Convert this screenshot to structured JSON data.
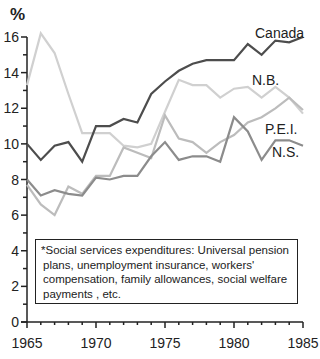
{
  "chart_data": {
    "type": "line",
    "title": "",
    "xlabel": "",
    "ylabel": "%",
    "xlim": [
      1965,
      1985
    ],
    "ylim": [
      0,
      16
    ],
    "x_ticks": [
      1965,
      1970,
      1975,
      1980,
      1985
    ],
    "y_ticks": [
      0,
      2,
      4,
      6,
      8,
      10,
      12,
      14,
      16
    ],
    "grid": false,
    "legend": "inline labels at line ends",
    "x": [
      1965,
      1966,
      1967,
      1968,
      1969,
      1970,
      1971,
      1972,
      1973,
      1974,
      1975,
      1976,
      1977,
      1978,
      1979,
      1980,
      1981,
      1982,
      1983,
      1984,
      1985
    ],
    "series": [
      {
        "name": "Canada",
        "color": "#4d4d4d",
        "values": [
          10.0,
          9.1,
          9.9,
          10.1,
          9.0,
          11.0,
          11.0,
          11.4,
          11.2,
          12.8,
          13.5,
          14.1,
          14.5,
          14.7,
          14.7,
          14.7,
          15.6,
          15.0,
          15.8,
          15.7,
          16.0
        ]
      },
      {
        "name": "N.B.",
        "color": "#d0d0d0",
        "values": [
          13.3,
          16.2,
          15.1,
          12.8,
          10.6,
          10.6,
          10.6,
          9.9,
          9.8,
          10.0,
          11.8,
          13.6,
          13.3,
          13.3,
          12.6,
          13.1,
          13.2,
          12.6,
          13.2,
          12.6,
          11.7
        ]
      },
      {
        "name": "P.E.I.",
        "color": "#bcbcbc",
        "values": [
          7.7,
          6.6,
          6.0,
          7.6,
          7.2,
          8.2,
          8.2,
          9.8,
          9.5,
          9.2,
          11.6,
          10.3,
          10.1,
          9.5,
          10.1,
          10.5,
          11.2,
          11.5,
          12.0,
          12.6,
          11.9
        ]
      },
      {
        "name": "N.S.",
        "color": "#8c8c8c",
        "values": [
          8.0,
          7.1,
          7.4,
          7.2,
          7.1,
          8.1,
          8.0,
          8.2,
          8.2,
          9.3,
          10.1,
          9.1,
          9.3,
          9.3,
          9.0,
          11.5,
          10.7,
          9.1,
          10.2,
          10.2,
          9.9
        ]
      }
    ],
    "annotations": [
      "*Social services expenditures: Universal pension plans, unemployment insurance, workers' compensation, family allowances, social welfare payments , etc."
    ]
  },
  "axis": {
    "y_unit": "%",
    "y_labels": [
      "0",
      "2",
      "4",
      "6",
      "8",
      "10",
      "12",
      "14",
      "16"
    ],
    "x_labels": [
      "1965",
      "1970",
      "1975",
      "1980",
      "1985"
    ]
  },
  "labels": {
    "canada": "Canada",
    "nb": "N.B.",
    "pei": "P.E.I.",
    "ns": "N.S."
  },
  "note": {
    "lines": [
      "*Social services expenditures: Universal pension",
      "plans, unemployment insurance, workers'",
      "compensation, family allowances, social welfare",
      "payments , etc."
    ]
  }
}
